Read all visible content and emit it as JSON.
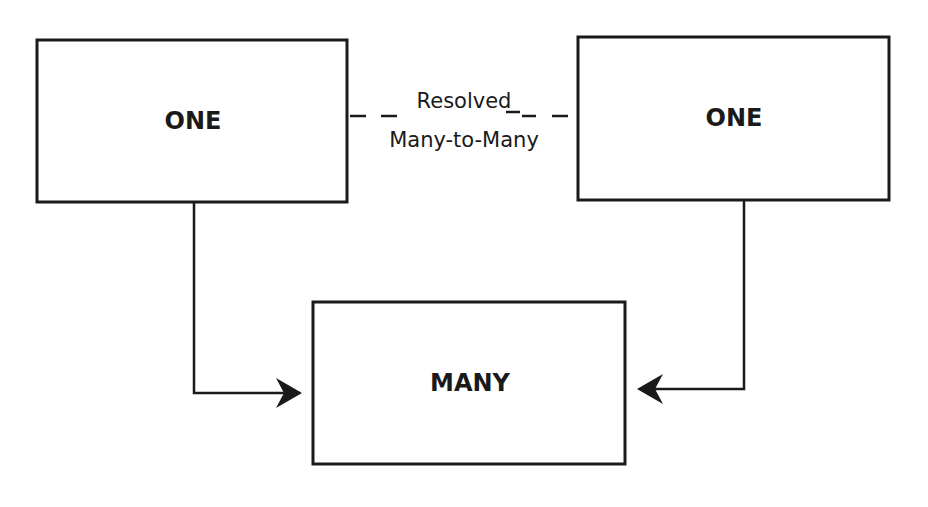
{
  "diagram": {
    "type": "entity-relationship",
    "entities": [
      {
        "id": "left-one",
        "label": "ONE"
      },
      {
        "id": "right-one",
        "label": "ONE"
      },
      {
        "id": "many",
        "label": "MANY"
      }
    ],
    "relationship": {
      "line1": "Resolved",
      "line2": "Many-to-Many",
      "style": "dashed",
      "between": [
        "left-one",
        "right-one"
      ]
    },
    "connectors": [
      {
        "from": "left-one",
        "to": "many",
        "arrow": "end"
      },
      {
        "from": "right-one",
        "to": "many",
        "arrow": "end"
      }
    ],
    "colors": {
      "stroke": "#1a1a1a",
      "background": "#ffffff"
    }
  }
}
